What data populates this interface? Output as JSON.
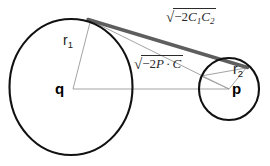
{
  "figure": {
    "background_color": "#ffffff",
    "stroke_color": "#1a1a1a",
    "thin_line_color": "#9a9a9a",
    "tangent_line_color": "#5e5e5e",
    "width": 270,
    "height": 166
  },
  "circles": {
    "large": {
      "center_label": "q",
      "radius_label": "r",
      "radius_subscript": "1",
      "cx": 71,
      "cy": 87,
      "rx": 61,
      "ry": 68
    },
    "small": {
      "center_label": "p",
      "radius_label": "r",
      "radius_subscript": "2",
      "cx": 229,
      "cy": 89,
      "rx": 30,
      "ry": 31
    }
  },
  "labels": {
    "tangent_length": {
      "surd": "√",
      "prefix": "−2",
      "term1": "C",
      "term1_sub": "1",
      "term2": "C",
      "term2_sub": "2",
      "plain": "√(−2C₁C₂)"
    },
    "center_distance": {
      "surd": "√",
      "prefix": "−2",
      "term1": "P",
      "operator": "·",
      "term2": "C",
      "plain": "√(−2P·C)"
    },
    "radius_large": {
      "base": "r",
      "sub": "1"
    },
    "radius_small": {
      "base": "r",
      "sub": "2"
    },
    "center_large": "q",
    "center_small": "p"
  }
}
